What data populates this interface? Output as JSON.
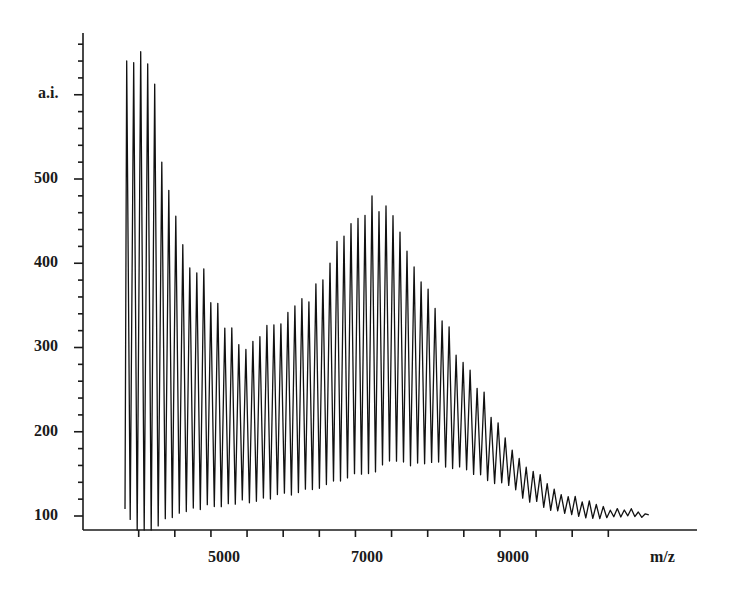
{
  "chart_data": {
    "type": "line",
    "title": "",
    "xlabel": "m/z",
    "ylabel": "a.i.",
    "x_ticks": [
      5000,
      7000,
      9000
    ],
    "y_ticks": [
      100,
      200,
      300,
      400,
      500
    ],
    "xlim": [
      3400,
      10800
    ],
    "ylim": [
      80,
      680
    ],
    "grid": false,
    "legend": null,
    "line_color": "#111111",
    "peak_spacing_mz": 97,
    "series": [
      {
        "name": "peak envelope (maxima)",
        "x": [
          3550,
          3650,
          3800,
          3950,
          4000,
          4100,
          4200,
          4300,
          4400,
          4500,
          4600,
          4700,
          4800,
          4900,
          5000,
          5100,
          5200,
          5300,
          5400,
          5500,
          5600,
          5700,
          5800,
          5900,
          6000,
          6100,
          6200,
          6300,
          6400,
          6500,
          6600,
          6700,
          6800,
          6900,
          7000,
          7100,
          7200,
          7300,
          7400,
          7500,
          7600,
          7700,
          7800,
          7900,
          8000,
          8100,
          8200,
          8300,
          8400,
          8500,
          8600,
          8700,
          8800,
          8900,
          9000,
          9100,
          9200,
          9300,
          9400,
          9500,
          9600,
          9800,
          10000,
          10200,
          10400,
          10600,
          10800
        ],
        "values": [
          640,
          660,
          660,
          660,
          560,
          520,
          470,
          455,
          400,
          395,
          405,
          370,
          360,
          330,
          325,
          320,
          300,
          305,
          320,
          330,
          340,
          335,
          345,
          350,
          355,
          365,
          380,
          395,
          400,
          420,
          440,
          455,
          460,
          470,
          480,
          470,
          460,
          445,
          430,
          410,
          400,
          380,
          360,
          350,
          340,
          310,
          290,
          280,
          265,
          250,
          230,
          215,
          195,
          185,
          175,
          165,
          155,
          148,
          140,
          135,
          130,
          122,
          118,
          112,
          110,
          108,
          106
        ]
      },
      {
        "name": "trough envelope (minima)",
        "x": [
          3550,
          3700,
          3900,
          4100,
          4300,
          4500,
          4800,
          5000,
          5300,
          5600,
          6000,
          6400,
          6800,
          7000,
          7200,
          7600,
          8000,
          8400,
          8800,
          9200,
          9600,
          10000,
          10400,
          10800
        ],
        "values": [
          110,
          85,
          80,
          95,
          105,
          110,
          112,
          115,
          118,
          122,
          130,
          140,
          150,
          155,
          162,
          165,
          160,
          150,
          138,
          118,
          105,
          100,
          98,
          100
        ]
      }
    ],
    "annotations": []
  },
  "axes": {
    "y_label": "a.i.",
    "x_label": "m/z",
    "y_tick_labels": [
      "100",
      "200",
      "300",
      "400",
      "500"
    ],
    "x_tick_labels": [
      "5000",
      "7000",
      "9000"
    ]
  }
}
